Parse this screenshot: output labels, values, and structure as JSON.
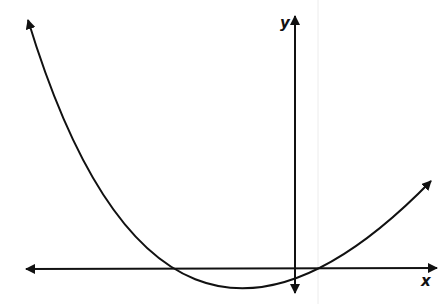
{
  "diagram": {
    "type": "graph-of-function",
    "axes": {
      "x_label": "x",
      "y_label": "y"
    },
    "curve": {
      "shape": "parabola",
      "opens": "up",
      "vertex_on_y_axis": true,
      "vertex_above_x_axis": true,
      "arrows_both_ends": true
    },
    "colors": {
      "stroke": "#111111",
      "background": "#ffffff",
      "artifact_line": "#e8e8e8"
    }
  }
}
